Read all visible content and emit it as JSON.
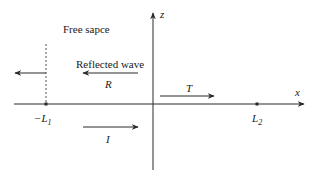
{
  "diagram": {
    "region_label": "Free sapce",
    "axes": {
      "x_label": "x",
      "z_label": "z"
    },
    "markers": {
      "left": {
        "label_prefix": "−L",
        "label_sub": "1"
      },
      "right": {
        "label_prefix": "L",
        "label_sub": "2"
      }
    },
    "waves": {
      "reflected_caption": "Reflected wave",
      "reflected_symbol": "R",
      "transmitted_symbol": "T",
      "incident_symbol": "I"
    },
    "colors": {
      "line": "#2a2a2a",
      "background": "#ffffff"
    }
  }
}
